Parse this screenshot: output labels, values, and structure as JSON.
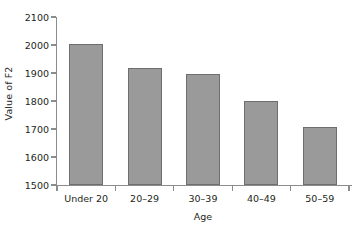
{
  "chart_data": {
    "type": "bar",
    "title": "",
    "subtitle": "",
    "xlabel": "Age",
    "ylabel": "Value of F2",
    "categories": [
      "Under 20",
      "20–29",
      "30–39",
      "40–49",
      "50–59"
    ],
    "values": [
      2005,
      1918,
      1895,
      1800,
      1706
    ],
    "ylim": [
      1500,
      2100
    ],
    "yticks": [
      1500,
      1600,
      1700,
      1800,
      1900,
      2000,
      2100
    ],
    "ytick_labels": [
      "1500",
      "1600",
      "1700",
      "1800",
      "1900",
      "2000",
      "2100"
    ],
    "grid": false,
    "legend": null,
    "series": [
      {
        "name": "Value of F2",
        "values": [
          2005,
          1918,
          1895,
          1800,
          1706
        ]
      }
    ],
    "colors": {
      "bar_fill": "#9a9a9a",
      "bar_stroke": "#6e6e6e",
      "axis": "#8c8c8c",
      "text": "#231f20",
      "background": "#ffffff"
    }
  }
}
